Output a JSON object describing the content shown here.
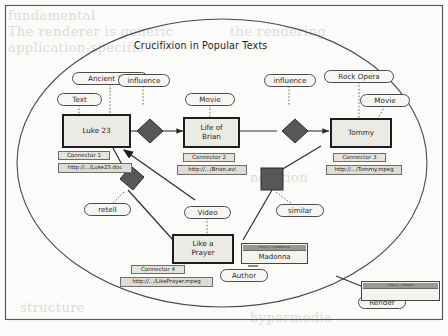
{
  "figure": {
    "title": "Crucifixion in Popular Texts",
    "frame_shape": "rectangle-with-inner-ellipse"
  },
  "colors": {
    "page_background": "#fbfbfa",
    "entity_fill": "#eceae5",
    "entity_border": "#1d1d1d",
    "capsule_fill": "#f7f6f3",
    "capsule_border": "#4a4a4a",
    "url_fill": "#dedcd6",
    "glyph_fill": "#5a5a5a",
    "line": "#3a3a3a",
    "bleed_text": "#dedbd6"
  },
  "entities": [
    {
      "id": "luke23",
      "label": "Luke 23",
      "label_lines": [
        "Luke 23"
      ]
    },
    {
      "id": "brian",
      "label": "Life of Brian",
      "label_lines": [
        "Life of",
        "Brian"
      ]
    },
    {
      "id": "tommy",
      "label": "Tommy",
      "label_lines": [
        "Tommy"
      ]
    },
    {
      "id": "prayer",
      "label": "Like a Prayer",
      "label_lines": [
        "Like a",
        "Prayer"
      ]
    }
  ],
  "type_capsules": [
    {
      "id": "ancient-text",
      "label": "Ancient Text",
      "attaches_to": "luke23"
    },
    {
      "id": "text",
      "label": "Text",
      "attaches_to": "luke23"
    },
    {
      "id": "movie-brian",
      "label": "Movie",
      "attaches_to": "brian"
    },
    {
      "id": "rock-opera",
      "label": "Rock Opera",
      "attaches_to": "tommy"
    },
    {
      "id": "movie-tommy",
      "label": "Movie",
      "attaches_to": "tommy"
    },
    {
      "id": "video",
      "label": "Video",
      "attaches_to": "prayer"
    }
  ],
  "relation_capsules": [
    {
      "id": "influence-1",
      "label": "influence",
      "glyph": "diamond"
    },
    {
      "id": "influence-2",
      "label": "influence",
      "glyph": "diamond"
    },
    {
      "id": "retell",
      "label": "retell",
      "glyph": "square"
    },
    {
      "id": "similar",
      "label": "similar",
      "glyph": "square"
    },
    {
      "id": "author",
      "label": "Author",
      "glyph": "none"
    },
    {
      "id": "render",
      "label": "Render",
      "glyph": "none"
    }
  ],
  "connectors": [
    {
      "id": "connector-1",
      "label": "Connector 1",
      "url": "http://.../Luke23.doc"
    },
    {
      "id": "connector-2",
      "label": "Connector 2",
      "url": "http://.../Brian.avi"
    },
    {
      "id": "connector-3",
      "label": "Connector 3",
      "url": "http://.../Tommy.mpeg"
    },
    {
      "id": "connector-4",
      "label": "Connector 4",
      "url": "http://.../LikePrayer.mpeg"
    }
  ],
  "windows": [
    {
      "id": "madonna-window",
      "title_bar": "http://.../madonna",
      "body": "Madonna"
    },
    {
      "id": "render-window",
      "title_bar": "http://.../render",
      "body": ""
    }
  ],
  "bleed_text": [
    {
      "text": "fundamental"
    },
    {
      "text": "The renderer is generic"
    },
    {
      "text": "application-specific"
    },
    {
      "text": "the rendering"
    },
    {
      "text": "notation"
    },
    {
      "text": "structure"
    },
    {
      "text": "hypermedia"
    }
  ]
}
